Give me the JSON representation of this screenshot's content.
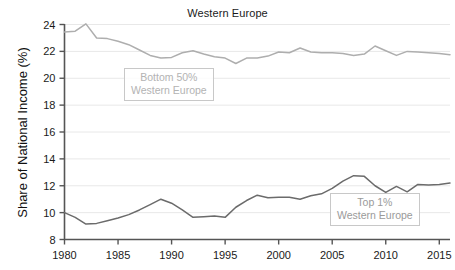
{
  "chart_data": {
    "type": "line",
    "title": "Western Europe",
    "xlabel": "",
    "ylabel": "Share of National Income (%)",
    "xlim": [
      1980,
      2016
    ],
    "ylim": [
      8,
      24
    ],
    "grid": true,
    "grid_axis": "y",
    "legend": "inline-annotations",
    "xticks": [
      "1980",
      "1985",
      "1990",
      "1995",
      "2000",
      "2005",
      "2010",
      "2015"
    ],
    "xtick_values": [
      1980,
      1985,
      1990,
      1995,
      2000,
      2005,
      2010,
      2015
    ],
    "yticks": [
      "8",
      "10",
      "12",
      "14",
      "16",
      "18",
      "20",
      "22",
      "24"
    ],
    "ytick_values": [
      8,
      10,
      12,
      14,
      16,
      18,
      20,
      22,
      24
    ],
    "x": [
      1980,
      1981,
      1982,
      1983,
      1984,
      1985,
      1986,
      1987,
      1988,
      1989,
      1990,
      1991,
      1992,
      1993,
      1994,
      1995,
      1996,
      1997,
      1998,
      1999,
      2000,
      2001,
      2002,
      2003,
      2004,
      2005,
      2006,
      2007,
      2008,
      2009,
      2010,
      2011,
      2012,
      2013,
      2014,
      2015,
      2016
    ],
    "series": [
      {
        "name": "Bottom 50% Western Europe",
        "color": "#aeaeae",
        "values": [
          23.45,
          23.5,
          24.05,
          23.0,
          22.95,
          22.75,
          22.5,
          22.1,
          21.7,
          21.5,
          21.55,
          21.9,
          22.05,
          21.8,
          21.6,
          21.5,
          21.1,
          21.5,
          21.5,
          21.65,
          21.95,
          21.9,
          22.25,
          21.95,
          21.9,
          21.9,
          21.85,
          21.7,
          21.8,
          22.4,
          22.05,
          21.7,
          22.0,
          21.95,
          21.9,
          21.85,
          21.75
        ]
      },
      {
        "name": "Top 1% Western Europe",
        "color": "#6b6b6b",
        "values": [
          10.0,
          9.65,
          9.15,
          9.2,
          9.4,
          9.6,
          9.85,
          10.2,
          10.6,
          11.0,
          10.7,
          10.2,
          9.65,
          9.7,
          9.75,
          9.65,
          10.4,
          10.9,
          11.3,
          11.1,
          11.15,
          11.15,
          11.0,
          11.25,
          11.4,
          11.8,
          12.35,
          12.75,
          12.7,
          12.0,
          11.5,
          11.95,
          11.55,
          12.1,
          12.05,
          12.1,
          12.2
        ]
      }
    ],
    "annotations": [
      {
        "id": "bottom50",
        "line1": "Bottom 50%",
        "line2": "Western Europe",
        "color": "#b3b3b3"
      },
      {
        "id": "top1",
        "line1": "Top 1%",
        "line2": "Western Europe",
        "color": "#9a9a9a"
      }
    ]
  },
  "colors": {
    "background": "#ffffff",
    "axis": "#555555",
    "grid": "#e8e8e8",
    "text": "#1a1a1a",
    "bottom50_line": "#aeaeae",
    "top1_line": "#6b6b6b"
  }
}
